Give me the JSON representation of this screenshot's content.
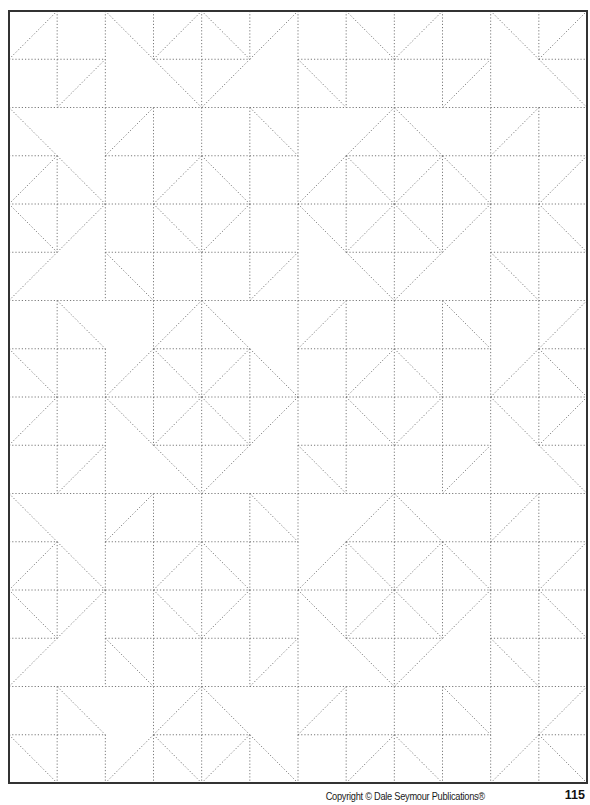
{
  "page": {
    "copyright": "Copyright © Dale Seymour Publications®",
    "page_number": "115"
  },
  "grid": {
    "left": 9,
    "top": 11,
    "right": 587,
    "bottom": 783,
    "columns": 12,
    "rows": 16,
    "tile_rows": 8,
    "border_color": "#333333",
    "line_color": "#7a7a7a",
    "diagonals": [
      {
        "row": 0,
        "cells": {
          "0": "/",
          "2": "\\",
          "3": "/",
          "4": "\\",
          "5": "/",
          "7": "\\",
          "8": "/",
          "10": "\\",
          "11": "/"
        }
      },
      {
        "row": 1,
        "cells": {
          "1": "/",
          "3": "\\",
          "4": "/",
          "6": "\\",
          "9": "/",
          "11": "\\"
        }
      },
      {
        "row": 2,
        "cells": {
          "0": "\\",
          "2": "/",
          "5": "\\",
          "7": "/",
          "8": "\\",
          "10": "/"
        }
      },
      {
        "row": 3,
        "cells": {
          "0": "/",
          "1": "\\",
          "3": "/",
          "4": "\\",
          "6": "/",
          "7": "\\",
          "8": "/",
          "9": "\\",
          "11": "/"
        }
      },
      {
        "row": 4,
        "cells": {
          "0": "\\",
          "1": "/",
          "3": "\\",
          "4": "/",
          "6": "\\",
          "7": "/",
          "8": "\\",
          "9": "/",
          "11": "\\"
        }
      },
      {
        "row": 5,
        "cells": {
          "0": "/",
          "2": "\\",
          "5": "/",
          "7": "\\",
          "8": "/",
          "10": "\\"
        }
      },
      {
        "row": 6,
        "cells": {
          "1": "\\",
          "3": "/",
          "4": "\\",
          "6": "/",
          "9": "\\",
          "11": "/"
        }
      },
      {
        "row": 7,
        "cells": {
          "0": "\\",
          "2": "/",
          "3": "\\",
          "4": "/",
          "5": "\\",
          "7": "/",
          "8": "\\",
          "10": "/",
          "11": "\\"
        }
      }
    ],
    "horizontal_gaps": {
      "1": [
        2,
        5,
        10
      ],
      "3": [
        1,
        6
      ],
      "5": [
        1,
        6,
        9
      ],
      "7": [
        2,
        5,
        10
      ]
    },
    "vertical_gaps": {
      "1": [
        3,
        5,
        11
      ],
      "2": [
        1,
        7,
        9
      ],
      "5": [
        1,
        7,
        9
      ],
      "6": [
        2,
        5
      ]
    }
  }
}
